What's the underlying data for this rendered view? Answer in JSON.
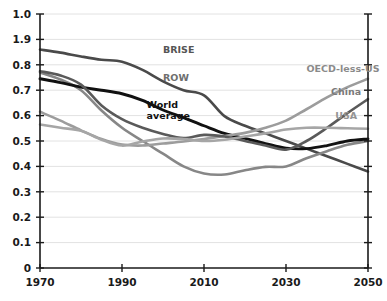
{
  "chart_data": {
    "type": "line",
    "title": "",
    "subtitle": "",
    "xlabel": "",
    "ylabel": "",
    "xlim": [
      1970,
      2050
    ],
    "ylim": [
      0,
      1.0
    ],
    "grid": true,
    "legend_position": "inline-labels",
    "x_ticks": [
      "1970",
      "1990",
      "2010",
      "2030",
      "2050"
    ],
    "x_tick_values": [
      1970,
      1990,
      2010,
      2030,
      2050
    ],
    "y_ticks": [
      "1.0",
      "1.9",
      "0.8",
      "0.7",
      "0.6",
      "0.5",
      "0.4",
      "0.3",
      "0.2",
      "0.1",
      "0"
    ],
    "y_tick_values": [
      1.0,
      0.9,
      0.8,
      0.7,
      0.6,
      0.5,
      0.4,
      0.3,
      0.2,
      0.1,
      0.0
    ],
    "x": [
      1970,
      1975,
      1980,
      1985,
      1990,
      1995,
      2000,
      2005,
      2010,
      2015,
      2020,
      2025,
      2030,
      2035,
      2040,
      2045,
      2050
    ],
    "series": [
      {
        "name": "BRISE",
        "color": "#4a4a4a",
        "width": 2.6,
        "label_x": 2000,
        "label_y": 0.845,
        "label_color": "#555555",
        "values": [
          0.86,
          0.848,
          0.833,
          0.82,
          0.812,
          0.78,
          0.735,
          0.7,
          0.68,
          0.598,
          0.56,
          0.53,
          0.5,
          0.47,
          0.44,
          0.41,
          0.38
        ]
      },
      {
        "name": "ROW",
        "color": "#878787",
        "width": 2.6,
        "label_x": 2000,
        "label_y": 0.738,
        "label_color": "#6e6e6e",
        "values": [
          0.77,
          0.742,
          0.7,
          0.62,
          0.552,
          0.5,
          0.45,
          0.4,
          0.372,
          0.368,
          0.385,
          0.398,
          0.4,
          0.432,
          0.46,
          0.485,
          0.5
        ]
      },
      {
        "name": "World average",
        "color": "#111111",
        "width": 2.9,
        "label_x": 1996,
        "label_y": 0.628,
        "label_color": "#111111",
        "values": [
          0.745,
          0.73,
          0.712,
          0.7,
          0.686,
          0.66,
          0.622,
          0.592,
          0.56,
          0.53,
          0.51,
          0.49,
          0.472,
          0.47,
          0.482,
          0.5,
          0.508
        ]
      },
      {
        "name": "OECD-less-US",
        "color": "#9c9c9c",
        "width": 2.6,
        "label_x": 2035,
        "label_y": 0.772,
        "label_color": "#8a8a8a",
        "values": [
          0.615,
          0.58,
          0.542,
          0.508,
          0.486,
          0.482,
          0.49,
          0.498,
          0.508,
          0.52,
          0.532,
          0.552,
          0.58,
          0.625,
          0.672,
          0.712,
          0.745
        ]
      },
      {
        "name": "China",
        "color": "#5a5a5a",
        "width": 2.6,
        "label_x": 2041,
        "label_y": 0.682,
        "label_color": "#7a7a7a",
        "values": [
          0.775,
          0.758,
          0.722,
          0.64,
          0.586,
          0.552,
          0.528,
          0.512,
          0.524,
          0.518,
          0.5,
          0.482,
          0.466,
          0.5,
          0.552,
          0.61,
          0.665
        ]
      },
      {
        "name": "USA",
        "color": "#a6a6a6",
        "width": 2.6,
        "label_x": 2042,
        "label_y": 0.588,
        "label_color": "#949494",
        "values": [
          0.565,
          0.552,
          0.54,
          0.505,
          0.482,
          0.498,
          0.51,
          0.508,
          0.5,
          0.505,
          0.518,
          0.53,
          0.545,
          0.552,
          0.552,
          0.55,
          0.548
        ]
      }
    ]
  }
}
